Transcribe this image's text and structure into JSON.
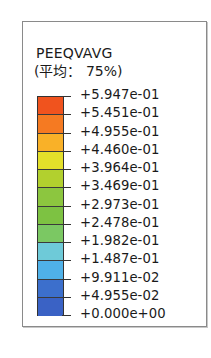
{
  "legend": {
    "title": "PEEQVAVG",
    "subtitle": "(平均： 75%)",
    "labels": [
      "+5.947e-01",
      "+5.451e-01",
      "+4.955e-01",
      "+4.460e-01",
      "+3.964e-01",
      "+3.469e-01",
      "+2.973e-01",
      "+2.478e-01",
      "+1.982e-01",
      "+1.487e-01",
      "+9.911e-02",
      "+4.955e-02",
      "+0.000e+00"
    ],
    "band_colors": [
      "#F0531E",
      "#F57A22",
      "#F9B128",
      "#E4E02A",
      "#B2D02E",
      "#8CC63F",
      "#7DC242",
      "#7BC863",
      "#6ECAD8",
      "#4FB1E8",
      "#3C6FCC",
      "#3A62C5"
    ]
  },
  "chart_data": {
    "type": "heatmap",
    "title": "PEEQVAVG",
    "subtitle": "(平均： 75%)",
    "colorbar": {
      "orientation": "vertical",
      "min": 0.0,
      "max": 0.5947,
      "tick_labels": [
        "+5.947e-01",
        "+5.451e-01",
        "+4.955e-01",
        "+4.460e-01",
        "+3.964e-01",
        "+3.469e-01",
        "+2.973e-01",
        "+2.478e-01",
        "+1.982e-01",
        "+1.487e-01",
        "+9.911e-02",
        "+4.955e-02",
        "+0.000e+00"
      ],
      "tick_values": [
        0.5947,
        0.5451,
        0.4955,
        0.446,
        0.3964,
        0.3469,
        0.2973,
        0.2478,
        0.1982,
        0.1487,
        0.09911,
        0.04955,
        0.0
      ],
      "band_colors_top_to_bottom": [
        "#F0531E",
        "#F57A22",
        "#F9B128",
        "#E4E02A",
        "#B2D02E",
        "#8CC63F",
        "#7DC242",
        "#7BC863",
        "#6ECAD8",
        "#4FB1E8",
        "#3C6FCC",
        "#3A62C5"
      ]
    }
  }
}
